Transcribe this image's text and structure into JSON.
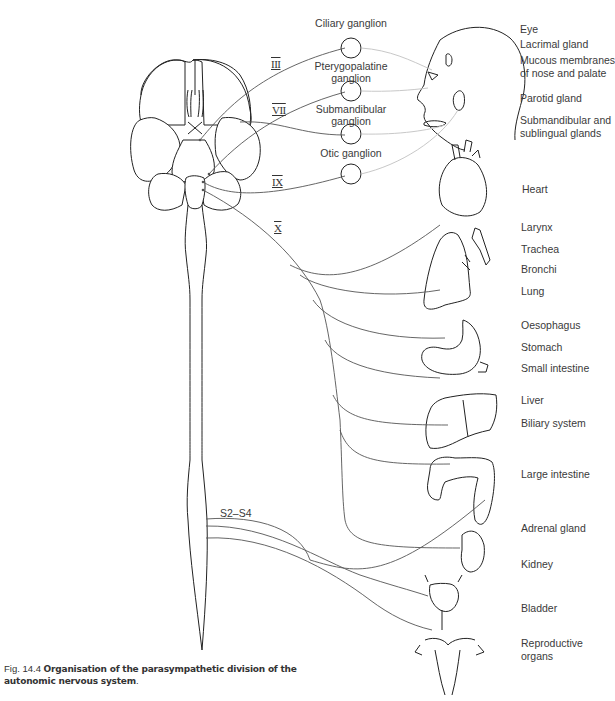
{
  "figure": {
    "caption_number": "Fig. 14.4",
    "caption_title": "Organisation of the parasympathetic division of the autonomic nervous system",
    "caption_title_line1": "Organisation of the parasympathetic division of the",
    "caption_title_line2": "autonomic nervous system",
    "caption_end": "."
  },
  "cranial_nerves": [
    {
      "id": "III",
      "label": "III"
    },
    {
      "id": "VII",
      "label": "VII"
    },
    {
      "id": "IX",
      "label": "IX"
    },
    {
      "id": "X",
      "label": "X"
    }
  ],
  "sacral": {
    "label": "S2–S4"
  },
  "ganglia": [
    {
      "id": "ciliary",
      "line1": "Ciliary ganglion",
      "line2": ""
    },
    {
      "id": "pterygopalatine",
      "line1": "Pterygopalatine",
      "line2": "ganglion"
    },
    {
      "id": "submandibular",
      "line1": "Submandibular",
      "line2": "ganglion"
    },
    {
      "id": "otic",
      "line1": "Otic ganglion",
      "line2": ""
    }
  ],
  "targets": [
    {
      "id": "eye",
      "label": "Eye"
    },
    {
      "id": "lacrimal",
      "label": "Lacrimal gland"
    },
    {
      "id": "mucous",
      "line1": "Mucous membranes",
      "line2": "of nose and palate"
    },
    {
      "id": "parotid",
      "label": "Parotid gland"
    },
    {
      "id": "submandibular-glands",
      "line1": "Submandibular and",
      "line2": "sublingual glands"
    },
    {
      "id": "heart",
      "label": "Heart"
    },
    {
      "id": "larynx",
      "label": "Larynx"
    },
    {
      "id": "trachea",
      "label": "Trachea"
    },
    {
      "id": "bronchi",
      "label": "Bronchi"
    },
    {
      "id": "lung",
      "label": "Lung"
    },
    {
      "id": "oesophagus",
      "label": "Oesophagus"
    },
    {
      "id": "stomach",
      "label": "Stomach"
    },
    {
      "id": "small-intestine",
      "label": "Small intestine"
    },
    {
      "id": "liver",
      "label": "Liver"
    },
    {
      "id": "biliary",
      "label": "Biliary system"
    },
    {
      "id": "large-intestine",
      "label": "Large intestine"
    },
    {
      "id": "adrenal",
      "label": "Adrenal gland"
    },
    {
      "id": "kidney",
      "label": "Kidney"
    },
    {
      "id": "bladder",
      "label": "Bladder"
    },
    {
      "id": "reproductive",
      "line1": "Reproductive",
      "line2": "organs"
    }
  ],
  "colors": {
    "preganglionic": "#555555",
    "postganglionic": "#c8c8c8",
    "outline": "#222222",
    "text": "#3a3a3a"
  }
}
